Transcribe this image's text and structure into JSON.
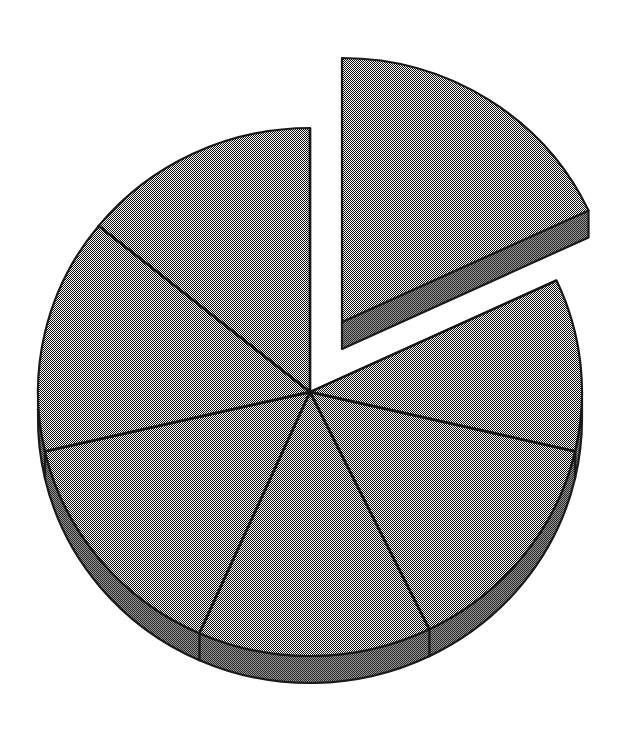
{
  "figure": {
    "name": "exploded-3d-pie-chart",
    "type": "pie",
    "width": 632,
    "height": 735,
    "background_color": "#ffffff",
    "style": "dithered halftone grayscale, monochrome scanned print",
    "has_labels": false,
    "has_legend": false,
    "has_title": false,
    "has_axes": false
  },
  "geometry": {
    "center_x": 310,
    "center_y": 392,
    "radius_x": 272,
    "radius_y": 264,
    "depth": 27,
    "explode_offset_x": 32,
    "explode_offset_y": -70,
    "start_angle_deg": -90,
    "direction": "clockwise"
  },
  "colors": {
    "slice_top_fill": "#b0b0b0",
    "slice_side_fill": "#6e6e6e",
    "outline": "#1a1a1a",
    "background": "#ffffff",
    "dither_dark": "#000000",
    "dither_light": "#ffffff"
  },
  "chart_data": {
    "type": "pie",
    "title": "",
    "subtitle": "",
    "xlabel": "",
    "ylabel": "",
    "legend_position": "none",
    "grid": false,
    "total": 100,
    "categories": [
      "Slice 1",
      "Slice 2",
      "Slice 3",
      "Slice 4",
      "Slice 5",
      "Slice 6",
      "Slice 7"
    ],
    "values": [
      18,
      15,
      13,
      15,
      14,
      13,
      12
    ],
    "start_angle_deg": -90,
    "slices": [
      {
        "index": 0,
        "label": "Slice 1",
        "value": 18,
        "percent": 18,
        "start_angle_deg": -90,
        "end_angle_deg": -25,
        "exploded": true,
        "fill": "#b0b0b0",
        "side_fill": "#6e6e6e"
      },
      {
        "index": 1,
        "label": "Slice 2",
        "value": 15,
        "percent": 15,
        "start_angle_deg": -25,
        "end_angle_deg": 13,
        "exploded": false,
        "fill": "#b0b0b0",
        "side_fill": "#6e6e6e"
      },
      {
        "index": 2,
        "label": "Slice 3",
        "value": 13,
        "percent": 13,
        "start_angle_deg": 13,
        "end_angle_deg": 64,
        "exploded": false,
        "fill": "#b0b0b0",
        "side_fill": "#6e6e6e"
      },
      {
        "index": 3,
        "label": "Slice 4",
        "value": 15,
        "percent": 15,
        "start_angle_deg": 64,
        "end_angle_deg": 114,
        "exploded": false,
        "fill": "#b0b0b0",
        "side_fill": "#6e6e6e"
      },
      {
        "index": 4,
        "label": "Slice 5",
        "value": 14,
        "percent": 14,
        "start_angle_deg": 114,
        "end_angle_deg": 167,
        "exploded": false,
        "fill": "#b0b0b0",
        "side_fill": "#6e6e6e"
      },
      {
        "index": 5,
        "label": "Slice 6",
        "value": 13,
        "percent": 13,
        "start_angle_deg": 167,
        "end_angle_deg": 219,
        "exploded": false,
        "fill": "#b0b0b0",
        "side_fill": "#6e6e6e"
      },
      {
        "index": 6,
        "label": "Slice 7",
        "value": 12,
        "percent": 12,
        "start_angle_deg": 219,
        "end_angle_deg": 270,
        "exploded": false,
        "fill": "#b0b0b0",
        "side_fill": "#6e6e6e"
      }
    ]
  }
}
